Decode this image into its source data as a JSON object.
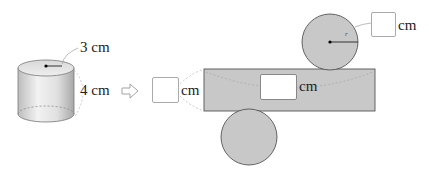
{
  "cylinder": {
    "radius_label": "3 cm",
    "height_label": "4 cm"
  },
  "arrow": {
    "icon": "hollow-right-arrow-icon"
  },
  "net": {
    "height_answer": {
      "value": "",
      "unit": "cm"
    },
    "length_answer": {
      "value": "",
      "unit": "cm"
    },
    "radius_answer": {
      "value": "",
      "unit": "cm"
    },
    "radius_marker": "r"
  },
  "colors": {
    "net_fill": "#c8c8c8",
    "net_stroke": "#555555",
    "answer_box_border": "#aaaaaa"
  }
}
